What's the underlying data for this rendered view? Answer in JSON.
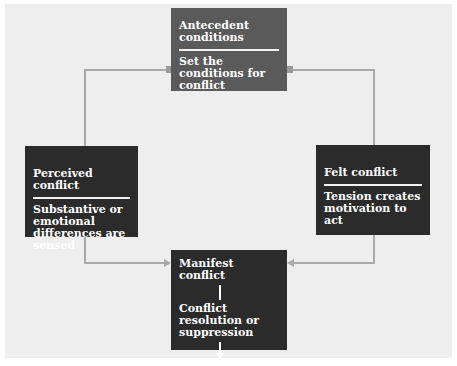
{
  "diagram": {
    "colors": {
      "panel_bg": "#eeeeee",
      "top_box": "#5a5a5a",
      "dark_box": "#2b2b2b",
      "connector": "#a9a9a9",
      "text": "#ffffff"
    },
    "nodes": {
      "antecedent": {
        "title": "Antecedent conditions",
        "description": "Set the conditions for conflict"
      },
      "perceived": {
        "title": "Perceived conflict",
        "description": "Substantive or emotional differences are sensed"
      },
      "felt": {
        "title": "Felt conflict",
        "description": "Tension creates motivation to act"
      },
      "manifest": {
        "steps": [
          "Manifest conflict",
          "Conflict resolution or suppression",
          "Conflict aftermath"
        ]
      }
    },
    "edges": [
      {
        "from": "antecedent",
        "to": "perceived"
      },
      {
        "from": "antecedent",
        "to": "felt"
      },
      {
        "from": "perceived",
        "to": "manifest"
      },
      {
        "from": "felt",
        "to": "manifest"
      }
    ]
  }
}
